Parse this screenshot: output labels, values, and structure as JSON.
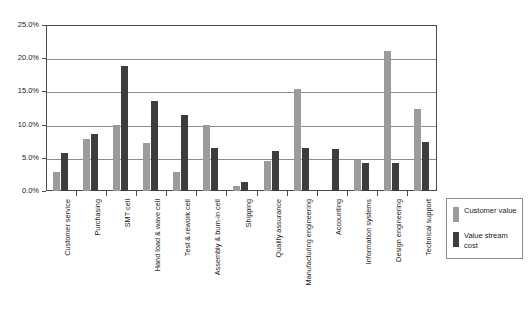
{
  "chart_data": {
    "type": "bar",
    "title": "",
    "subtitle": "",
    "xlabel": "",
    "ylabel": "",
    "ylim": [
      0,
      25
    ],
    "y_tick_labels": [
      "0.0%",
      "5.0%",
      "10.0%",
      "15.0%",
      "20.0%",
      "25.0%"
    ],
    "y_tick_values": [
      0,
      5,
      10,
      15,
      20,
      25
    ],
    "grid": true,
    "legend_position": "right",
    "value_suffix": "%",
    "categories": [
      "Customer service",
      "Purchasing",
      "SMT cell",
      "Hand load & wave cell",
      "Test & rework cell",
      "Assembly & burn-in cell",
      "Shipping",
      "Quality assurance",
      "Manufacturing engineering",
      "Accounting",
      "Information systems",
      "Design engineering",
      "Technical support"
    ],
    "series": [
      {
        "name": "Customer value",
        "color": "#9b9b9b",
        "values": [
          2.8,
          7.8,
          10.0,
          7.3,
          2.9,
          9.9,
          0.7,
          4.5,
          15.4,
          0.0,
          4.7,
          21.1,
          12.4
        ]
      },
      {
        "name": "Value stream cost",
        "color": "#3d3d3d",
        "values": [
          5.8,
          8.6,
          18.8,
          13.5,
          11.4,
          6.5,
          1.4,
          6.1,
          6.5,
          6.4,
          4.2,
          4.2,
          7.4
        ]
      }
    ]
  },
  "legend": {
    "items": [
      {
        "label": "Customer value",
        "color": "#9b9b9b"
      },
      {
        "label": "Value stream cost",
        "color": "#3d3d3d"
      }
    ]
  }
}
